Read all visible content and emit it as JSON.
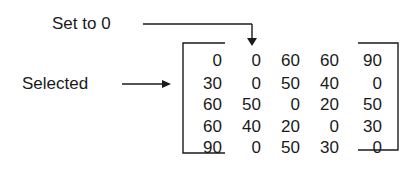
{
  "annotations": {
    "set_to_zero": "Set to 0",
    "selected": "Selected"
  },
  "matrix": {
    "rows": [
      [
        "0",
        "0",
        "60",
        "60",
        "90"
      ],
      [
        "30",
        "0",
        "50",
        "40",
        "0"
      ],
      [
        "60",
        "50",
        "0",
        "20",
        "50"
      ],
      [
        "60",
        "40",
        "20",
        "0",
        "30"
      ],
      [
        "90",
        "0",
        "50",
        "30",
        "0"
      ]
    ],
    "selected_row_index": 1,
    "set_to_zero_column_index": 1
  },
  "colors": {
    "ink": "#1a1a1a",
    "background": "#ffffff"
  }
}
